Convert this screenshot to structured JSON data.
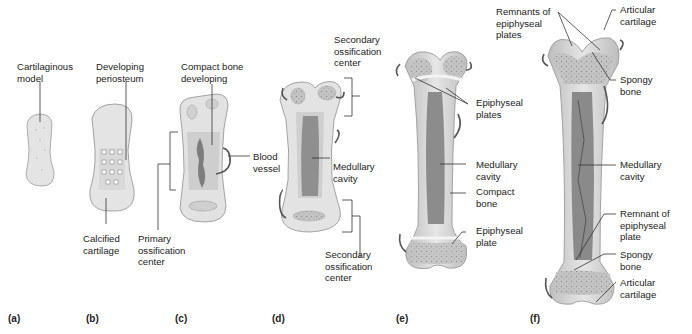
{
  "figure": {
    "panels": [
      {
        "id": "a",
        "letter": "(a)",
        "labels": [
          {
            "key": "cartilaginous_model",
            "lines": [
              "Cartilaginous",
              "model"
            ]
          }
        ]
      },
      {
        "id": "b",
        "letter": "(b)",
        "labels": [
          {
            "key": "developing_periosteum",
            "lines": [
              "Developing",
              "periosteum"
            ]
          },
          {
            "key": "calcified_cartilage",
            "lines": [
              "Calcified",
              "cartilage"
            ]
          }
        ]
      },
      {
        "id": "c",
        "letter": "(c)",
        "labels": [
          {
            "key": "compact_bone_developing",
            "lines": [
              "Compact bone",
              "developing"
            ]
          },
          {
            "key": "blood_vessel",
            "lines": [
              "Blood",
              "vessel"
            ]
          },
          {
            "key": "primary_ossification_center",
            "lines": [
              "Primary",
              "ossification",
              "center"
            ]
          }
        ]
      },
      {
        "id": "d",
        "letter": "(d)",
        "labels": [
          {
            "key": "secondary_ossification_center_top",
            "lines": [
              "Secondary",
              "ossification",
              "center"
            ]
          },
          {
            "key": "medullary_cavity",
            "lines": [
              "Medullary",
              "cavity"
            ]
          },
          {
            "key": "secondary_ossification_center_bottom",
            "lines": [
              "Secondary",
              "ossification",
              "center"
            ]
          }
        ]
      },
      {
        "id": "e",
        "letter": "(e)",
        "labels": [
          {
            "key": "epiphyseal_plates",
            "lines": [
              "Epiphyseal",
              "plates"
            ]
          },
          {
            "key": "medullary_cavity",
            "lines": [
              "Medullary",
              "cavity"
            ]
          },
          {
            "key": "compact_bone",
            "lines": [
              "Compact",
              "bone"
            ]
          },
          {
            "key": "epiphyseal_plate",
            "lines": [
              "Epiphyseal",
              "plate"
            ]
          }
        ]
      },
      {
        "id": "f",
        "letter": "(f)",
        "labels": [
          {
            "key": "remnants_of_epiphyseal_plates",
            "lines": [
              "Remnants of",
              "epiphyseal",
              "plates"
            ]
          },
          {
            "key": "articular_cartilage_top",
            "lines": [
              "Articular",
              "cartilage"
            ]
          },
          {
            "key": "spongy_bone_top",
            "lines": [
              "Spongy",
              "bone"
            ]
          },
          {
            "key": "medullary_cavity",
            "lines": [
              "Medullary",
              "cavity"
            ]
          },
          {
            "key": "remnant_of_epiphyseal_plate",
            "lines": [
              "Remnant of",
              "epiphyseal",
              "plate"
            ]
          },
          {
            "key": "spongy_bone_bottom",
            "lines": [
              "Spongy",
              "bone"
            ]
          },
          {
            "key": "articular_cartilage_bottom",
            "lines": [
              "Articular",
              "cartilage"
            ]
          }
        ]
      }
    ],
    "colors": {
      "cartilage": "#e3e3e3",
      "cartilage_edge": "#9a9a9a",
      "bone": "#d2d2d2",
      "spongy": "#bdbdbd",
      "cavity": "#8a8a8a",
      "vessel": "#555555",
      "leader": "#333333"
    }
  }
}
